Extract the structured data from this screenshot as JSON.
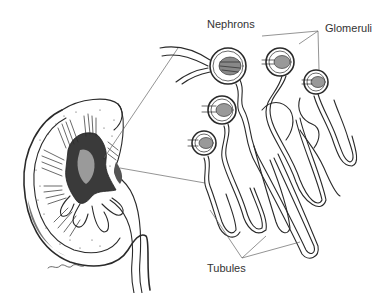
{
  "figure": {
    "labels": {
      "nephrons": "Nephrons",
      "glomeruli": "Glomeruli",
      "tubules": "Tubules"
    },
    "signature": "David J. Mascaro",
    "colors": {
      "ink": "#2a2a2a",
      "leader": "#666666",
      "label_text": "#333333",
      "background": "#ffffff"
    }
  }
}
